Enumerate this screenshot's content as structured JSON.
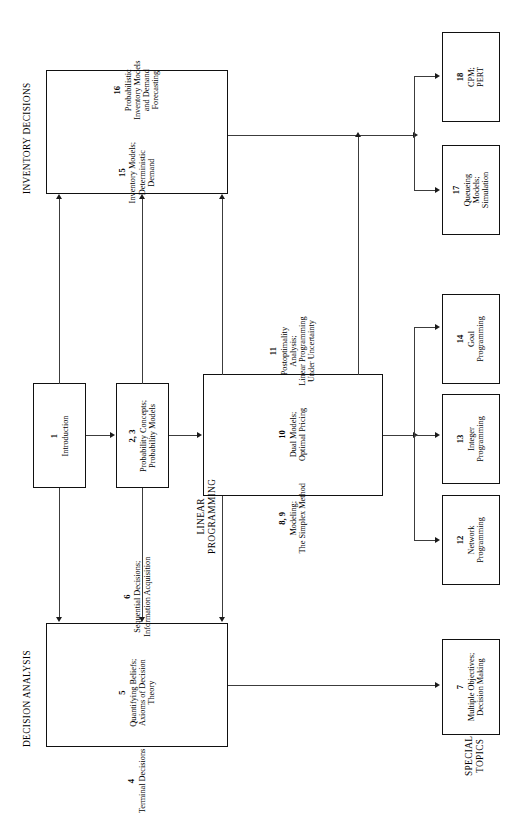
{
  "figure": {
    "orientation": "landscape-rotated-90",
    "colors": {
      "line": "#3c3c3c",
      "border": "#111111",
      "text": "#000000",
      "background": "#ffffff"
    }
  },
  "groups": {
    "inventory": "INVENTORY DECISIONS",
    "decision": "DECISION ANALYSIS",
    "linear": "LINEAR\nPROGRAMMING",
    "linear_l1": "LINEAR",
    "linear_l2": "PROGRAMMING",
    "special_l1": "SPECIAL",
    "special_l2": "TOPICS"
  },
  "boxes": {
    "inventory": [
      {
        "num": "15",
        "title": "Inventory Models;\nDeterministic\nDemand",
        "t1": "Inventory Models;",
        "t2": "Deterministic",
        "t3": "Demand"
      },
      {
        "num": "16",
        "title": "Probabilistic\nInventory Models\nand Demand\nForecasting",
        "t1": "Probabilistic",
        "t2": "Inventory Models",
        "t3": "and Demand",
        "t4": "Forecasting"
      }
    ],
    "intro": {
      "num": "1",
      "t1": "Introduction"
    },
    "prob": {
      "num": "2, 3",
      "t1": "Probability Concepts;",
      "t2": "Probability Models"
    },
    "linear": [
      {
        "num": "8, 9",
        "t1": "Modeling;",
        "t2": "The Simplex Method"
      },
      {
        "num": "10",
        "t1": "Dual Models;",
        "t2": "Optimal Pricing"
      },
      {
        "num": "11",
        "t1": "Postoptimality",
        "t2": "Analysis;",
        "t3": "Linear Programming",
        "t4": "Under Uncertainty"
      }
    ],
    "decision": [
      {
        "num": "4",
        "t1": "Terminal Decisions"
      },
      {
        "num": "5",
        "t1": "Quantifying Beliefs;",
        "t2": "Axioms of Decision",
        "t3": "Theory"
      },
      {
        "num": "6",
        "t1": "Sequential Decisions;",
        "t2": "Information Acquisition"
      }
    ],
    "ch18": {
      "num": "18",
      "t1": "CPM;",
      "t2": "PERT"
    },
    "ch17": {
      "num": "17",
      "t1": "Queueing",
      "t2": "Models;",
      "t3": "Simulation"
    },
    "ch14": {
      "num": "14",
      "t1": "Goal",
      "t2": "Programming"
    },
    "ch13": {
      "num": "13",
      "t1": "Integer",
      "t2": "Programming"
    },
    "ch12": {
      "num": "12",
      "t1": "Network",
      "t2": "Programming"
    },
    "ch7": {
      "num": "7",
      "t1": "Multiple Objectives;",
      "t2": "Decision Making"
    }
  }
}
